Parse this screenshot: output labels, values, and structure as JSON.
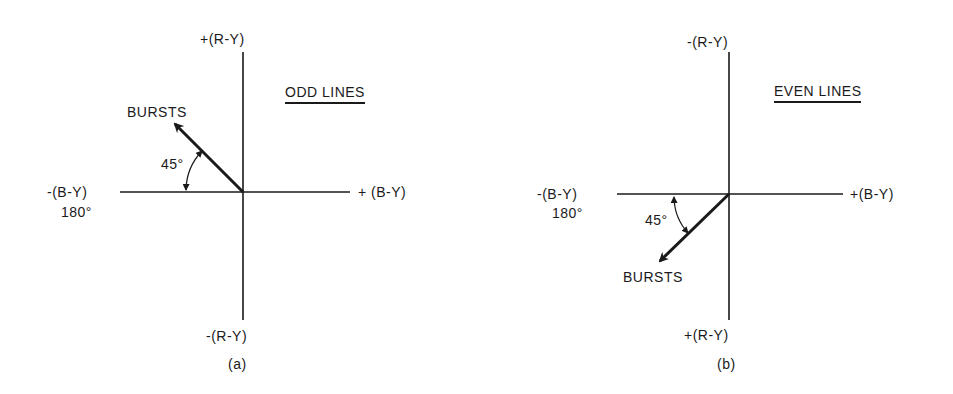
{
  "diagrams": [
    {
      "id": "a",
      "caption": "(a)",
      "title": "ODD LINES",
      "axis_top": "+(R-Y)",
      "axis_bottom": "-(R-Y)",
      "axis_left": "-(B-Y)",
      "axis_left_angle": "180°",
      "axis_right": "+ (B-Y)",
      "vector_label": "BURSTS",
      "angle_label": "45°"
    },
    {
      "id": "b",
      "caption": "(b)",
      "title": "EVEN LINES",
      "axis_top": "-(R-Y)",
      "axis_bottom": "+(R-Y)",
      "axis_left": "-(B-Y)",
      "axis_left_angle": "180°",
      "axis_right": "+(B-Y)",
      "vector_label": "BURSTS",
      "angle_label": "45°"
    }
  ],
  "colors": {
    "ink": "#1a1a1a",
    "background": "#ffffff"
  }
}
